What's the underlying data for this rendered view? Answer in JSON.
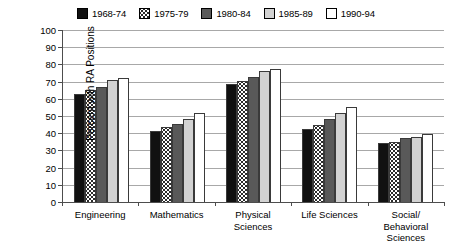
{
  "chart_data": {
    "type": "bar",
    "title": "",
    "subtitle": "",
    "xlabel": "",
    "ylabel": "Percent with RA Positions",
    "ylim": [
      0,
      100
    ],
    "ytick_step": 10,
    "yticks": [
      100,
      90,
      80,
      70,
      60,
      50,
      40,
      30,
      20,
      10,
      0
    ],
    "grid": true,
    "legend_position": "top-center",
    "categories": [
      "Engineering",
      "Mathematics",
      "Physical\nSciences",
      "Life Sciences",
      "Social/\nBehavioral\nSciences"
    ],
    "series": [
      {
        "name": "1968-74",
        "swatch": "solid-black",
        "color": "#111111",
        "values": [
          63,
          41,
          68.5,
          42.5,
          34.5
        ]
      },
      {
        "name": "1975-79",
        "swatch": "white-dotted",
        "color": "#ffffff",
        "values": [
          65,
          43.5,
          70.5,
          45,
          35
        ]
      },
      {
        "name": "1980-84",
        "swatch": "solid-dark-gray",
        "color": "#595959",
        "values": [
          67,
          45.5,
          72.5,
          48,
          37
        ]
      },
      {
        "name": "1985-89",
        "swatch": "solid-light-gray",
        "color": "#d2d2d2",
        "values": [
          71,
          48.5,
          76,
          52,
          37.5
        ]
      },
      {
        "name": "1990-94",
        "swatch": "solid-white",
        "color": "#ffffff",
        "values": [
          72,
          51.5,
          77.5,
          55,
          39.5
        ]
      }
    ]
  },
  "axis": {
    "y_title": "Percent with RA Positions"
  }
}
